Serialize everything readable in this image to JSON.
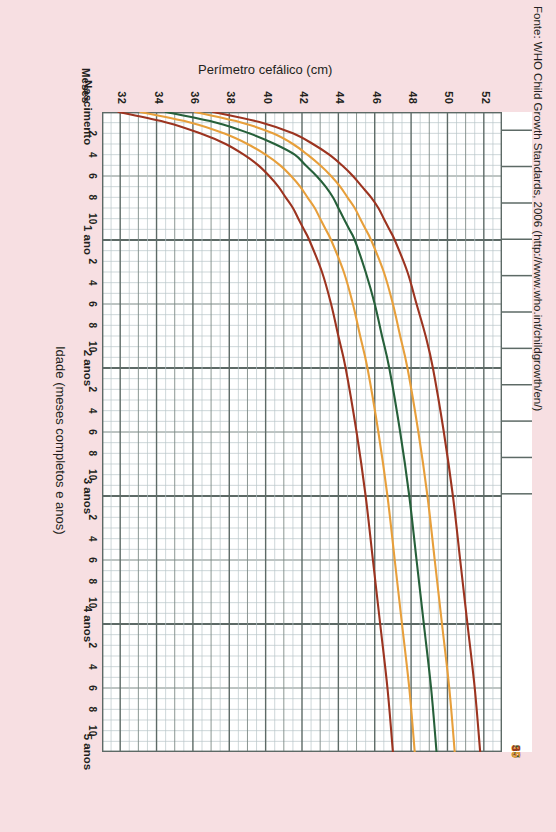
{
  "chart_data": {
    "type": "line",
    "title": "",
    "xlabel": "Idade (meses completos e anos)",
    "ylabel": "Perímetro cefálico (cm)",
    "x_unit_label": "Meses",
    "xlim": [
      0,
      60
    ],
    "ylim": [
      31,
      53
    ],
    "y_ticks": [
      52,
      50,
      48,
      46,
      44,
      42,
      40,
      38,
      36,
      34,
      32
    ],
    "x_major_labels": [
      "Nascimento",
      "1 ano",
      "2 anos",
      "3 anos",
      "4 anos",
      "5 anos"
    ],
    "x_major_values": [
      0,
      12,
      24,
      36,
      48,
      60
    ],
    "x_minor_ticks": [
      2,
      4,
      6,
      8,
      10
    ],
    "grid": true,
    "legend_position": "curve-end-top",
    "series": [
      {
        "name": "97",
        "label": "97",
        "color": "#9c3420",
        "x": [
          0,
          1,
          2,
          3,
          4,
          5,
          6,
          7,
          8,
          9,
          10,
          11,
          12,
          15,
          18,
          21,
          24,
          30,
          36,
          42,
          48,
          54,
          60
        ],
        "values": [
          37.1,
          39.8,
          41.5,
          42.6,
          43.5,
          44.2,
          44.8,
          45.3,
          45.8,
          46.2,
          46.5,
          46.8,
          47.1,
          47.8,
          48.3,
          48.8,
          49.2,
          49.8,
          50.3,
          50.7,
          51.1,
          51.5,
          51.8
        ]
      },
      {
        "name": "85",
        "label": "85",
        "color": "#e79f3b",
        "x": [
          0,
          1,
          2,
          3,
          4,
          5,
          6,
          7,
          8,
          9,
          10,
          11,
          12,
          15,
          18,
          21,
          24,
          30,
          36,
          42,
          48,
          54,
          60
        ],
        "values": [
          36.1,
          38.7,
          40.4,
          41.5,
          42.3,
          43.0,
          43.6,
          44.1,
          44.5,
          44.9,
          45.2,
          45.5,
          45.8,
          46.5,
          47.0,
          47.4,
          47.8,
          48.4,
          48.9,
          49.3,
          49.7,
          50.1,
          50.4
        ]
      },
      {
        "name": "50",
        "label": "50",
        "color": "#26603a",
        "x": [
          0,
          1,
          2,
          3,
          4,
          5,
          6,
          7,
          8,
          9,
          10,
          11,
          12,
          15,
          18,
          21,
          24,
          30,
          36,
          42,
          48,
          54,
          60
        ],
        "values": [
          34.5,
          37.3,
          39.1,
          40.5,
          41.6,
          42.2,
          42.8,
          43.3,
          43.7,
          44.0,
          44.3,
          44.6,
          44.9,
          45.5,
          46.0,
          46.4,
          46.8,
          47.4,
          47.9,
          48.3,
          48.7,
          49.1,
          49.4
        ]
      },
      {
        "name": "15",
        "label": "15",
        "color": "#e79f3b",
        "x": [
          0,
          1,
          2,
          3,
          4,
          5,
          6,
          7,
          8,
          9,
          10,
          11,
          12,
          15,
          18,
          21,
          24,
          30,
          36,
          42,
          48,
          54,
          60
        ],
        "values": [
          33.1,
          35.9,
          37.7,
          39.0,
          40.0,
          40.8,
          41.4,
          41.9,
          42.3,
          42.7,
          43.0,
          43.3,
          43.6,
          44.3,
          44.8,
          45.2,
          45.6,
          46.2,
          46.7,
          47.1,
          47.5,
          47.9,
          48.2
        ]
      },
      {
        "name": "3",
        "label": "3",
        "color": "#9c3420",
        "x": [
          0,
          1,
          2,
          3,
          4,
          5,
          6,
          7,
          8,
          9,
          10,
          11,
          12,
          15,
          18,
          21,
          24,
          30,
          36,
          42,
          48,
          54,
          60
        ],
        "values": [
          31.9,
          34.6,
          36.4,
          37.8,
          38.8,
          39.6,
          40.2,
          40.7,
          41.1,
          41.5,
          41.8,
          42.1,
          42.4,
          43.1,
          43.6,
          44.0,
          44.4,
          45.0,
          45.5,
          45.9,
          46.3,
          46.7,
          47.0
        ]
      }
    ]
  },
  "axis": {
    "y_label": "Perímetro cefálico (cm)",
    "x_label": "Idade (meses completos e anos)",
    "months_label": "Meses",
    "y_ticks": [
      "52",
      "50",
      "48",
      "46",
      "44",
      "42",
      "40",
      "38",
      "36",
      "34",
      "32"
    ],
    "x_major": [
      "Nascimento",
      "1 ano",
      "2 anos",
      "3 anos",
      "4 anos",
      "5 anos"
    ],
    "x_minor": [
      "2",
      "4",
      "6",
      "8",
      "10"
    ]
  },
  "percentiles": [
    {
      "label": "97",
      "color": "#9c3420"
    },
    {
      "label": "85",
      "color": "#e79f3b"
    },
    {
      "label": "50",
      "color": "#26603a"
    },
    {
      "label": "15",
      "color": "#e79f3b"
    },
    {
      "label": "3",
      "color": "#9c3420"
    }
  ],
  "source": {
    "text": "Fonte: WHO Child Growth Standards, 2006 (http://www.who.int/childgrowth/en/)"
  },
  "colors": {
    "page_background": "#f7dfe2",
    "plot_background": "#ffffff",
    "grid_minor": "#b9c6c9",
    "grid_major": "#5d6a66",
    "axis": "#4a554f",
    "text": "#231f20",
    "outer_p": "#9c3420",
    "inner_p": "#e79f3b",
    "median_p": "#26603a"
  }
}
